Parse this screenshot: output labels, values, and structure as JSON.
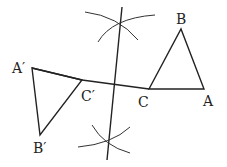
{
  "diagram": {
    "labels": {
      "A": "A",
      "B": "B",
      "C": "C",
      "A_prime": "A′",
      "B_prime": "B′",
      "C_prime": "C′"
    },
    "colors": {
      "stroke": "#222222",
      "background": "#ffffff"
    }
  }
}
